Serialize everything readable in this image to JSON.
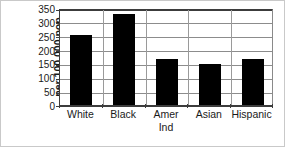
{
  "chart_data": {
    "type": "bar",
    "title": "",
    "subtitle": "",
    "xlabel": "",
    "ylabel": "per 100,000 pop",
    "categories": [
      "White",
      "Black",
      "Amer Ind",
      "Asian",
      "Hispanic"
    ],
    "category_lines": [
      [
        "White"
      ],
      [
        "Black"
      ],
      [
        "Amer",
        "Ind"
      ],
      [
        "Asian"
      ],
      [
        "Hispanic"
      ]
    ],
    "values": [
      253,
      328,
      166,
      147,
      166
    ],
    "series": [
      {
        "name": "rate",
        "values": [
          253,
          328,
          166,
          147,
          166
        ],
        "color": "#000000"
      }
    ],
    "ylim": [
      0,
      350
    ],
    "ytick_values": [
      0,
      50,
      100,
      150,
      200,
      250,
      300,
      350
    ],
    "ytick_labels": [
      "0",
      "50",
      "100",
      "150",
      "200",
      "250",
      "300",
      "350"
    ],
    "grid": true,
    "grid_axis": "y",
    "legend": false,
    "legend_position": "none",
    "bar_color": "#000000",
    "gridline_color": "#8c8c8c",
    "axis_color": "#3c3c3c",
    "background_color": "#ffffff",
    "text_color": "#1a1a1a",
    "annotations": []
  }
}
